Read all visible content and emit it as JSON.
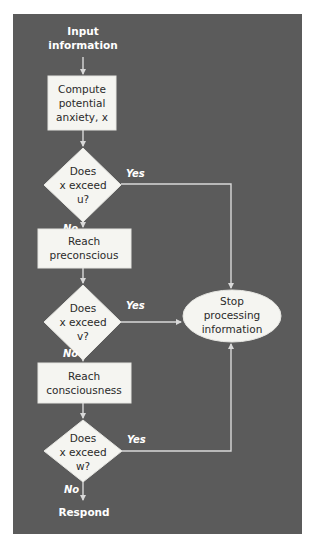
{
  "colors": {
    "panel": "#5b5b5b",
    "shape_fill": "#f5f5f1",
    "shape_stroke": "#e6e6e2",
    "connector": "#d9d9d9",
    "text_dark": "#2a2a2a",
    "text_light": "#ffffff"
  },
  "diagram": {
    "type": "flowchart",
    "start": {
      "line1": "Input",
      "line2": "information"
    },
    "nodes": [
      {
        "id": "compute",
        "shape": "rectangle",
        "lines": [
          "Compute",
          "potential",
          "anxiety, x"
        ]
      },
      {
        "id": "decision_u",
        "shape": "diamond",
        "lines": [
          "Does",
          "x exceed",
          "u?"
        ]
      },
      {
        "id": "preconscious",
        "shape": "rectangle",
        "lines": [
          "Reach",
          "preconscious"
        ]
      },
      {
        "id": "decision_v",
        "shape": "diamond",
        "lines": [
          "Does",
          "x exceed",
          "v?"
        ]
      },
      {
        "id": "consciousness",
        "shape": "rectangle",
        "lines": [
          "Reach",
          "consciousness"
        ]
      },
      {
        "id": "decision_w",
        "shape": "diamond",
        "lines": [
          "Does",
          "x exceed",
          "w?"
        ]
      },
      {
        "id": "stop",
        "shape": "ellipse",
        "lines": [
          "Stop",
          "processing",
          "information"
        ]
      }
    ],
    "end": {
      "label": "Respond"
    },
    "branch_labels": {
      "yes": "Yes",
      "no": "No"
    },
    "edges": [
      {
        "from": "input",
        "to": "compute"
      },
      {
        "from": "compute",
        "to": "decision_u"
      },
      {
        "from": "decision_u",
        "to": "preconscious",
        "label": "No"
      },
      {
        "from": "decision_u",
        "to": "stop",
        "label": "Yes"
      },
      {
        "from": "preconscious",
        "to": "decision_v"
      },
      {
        "from": "decision_v",
        "to": "consciousness",
        "label": "No"
      },
      {
        "from": "decision_v",
        "to": "stop",
        "label": "Yes"
      },
      {
        "from": "consciousness",
        "to": "decision_w"
      },
      {
        "from": "decision_w",
        "to": "respond",
        "label": "No"
      },
      {
        "from": "decision_w",
        "to": "stop",
        "label": "Yes"
      }
    ]
  }
}
